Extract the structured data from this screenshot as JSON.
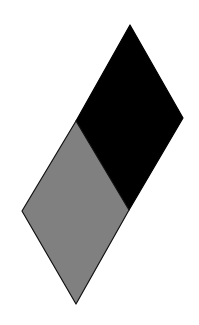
{
  "diagram": {
    "canvas": {
      "width": 199,
      "height": 325,
      "background": "#ffffff"
    },
    "shapes": [
      {
        "id": "upper-rhombus",
        "fill": "#000000",
        "stroke": "#000000",
        "points": "130,25 183,118 129,210 76,121"
      },
      {
        "id": "lower-rhombus",
        "fill": "#808080",
        "stroke": "#111111",
        "points": "76,121 129,210 76,304 22,211"
      }
    ]
  }
}
